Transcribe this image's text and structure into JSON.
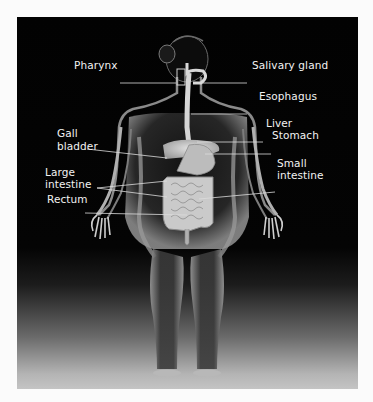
{
  "figure": {
    "background_color": "#020202",
    "label_color": "#f2f2f2",
    "labels": {
      "pharynx": "Pharynx",
      "salivary_gland": "Salivary gland",
      "esophagus": "Esophagus",
      "liver": "Liver",
      "stomach": "Stomach",
      "gall_bladder_1": "Gall",
      "gall_bladder_2": "bladder",
      "large_intestine_1": "Large",
      "large_intestine_2": "intestine",
      "small_intestine_1": "Small",
      "small_intestine_2": "intestine",
      "rectum": "Rectum"
    }
  }
}
